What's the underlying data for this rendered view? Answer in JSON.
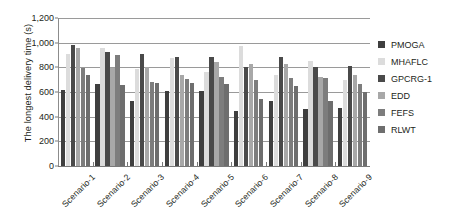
{
  "chart_data": {
    "type": "bar",
    "title": "",
    "subtitle": "",
    "xlabel": "",
    "ylabel": "The longest delivery time (s)",
    "ylim": [
      0,
      1200
    ],
    "ytick_values": [
      0,
      200,
      400,
      600,
      800,
      1000,
      1200
    ],
    "ytick_labels": [
      "0",
      "200",
      "400",
      "600",
      "800",
      "1,000",
      "1,200"
    ],
    "grid": true,
    "legend_position": "right",
    "categories": [
      "Scenario-1",
      "Scenario-2",
      "Scenario-3",
      "Scenario-4",
      "Scenario-5",
      "Scenario-6",
      "Scenario-7",
      "Scenario-8",
      "Scenario-9"
    ],
    "series": [
      {
        "name": "PMOGA",
        "color": "#3f3f3f",
        "values": [
          615,
          665,
          525,
          605,
          610,
          450,
          530,
          460,
          470
        ]
      },
      {
        "name": "MHAFLC",
        "color": "#dcdcdc",
        "values": [
          910,
          955,
          790,
          875,
          760,
          975,
          740,
          855,
          700
        ]
      },
      {
        "name": "GPCRG-1",
        "color": "#4a4a4a",
        "values": [
          980,
          925,
          905,
          880,
          880,
          800,
          880,
          800,
          810
        ]
      },
      {
        "name": "EDD",
        "color": "#a8a8a8",
        "values": [
          960,
          795,
          800,
          740,
          845,
          830,
          825,
          720,
          740
        ]
      },
      {
        "name": "FEFS",
        "color": "#7d7d7d",
        "values": [
          795,
          900,
          680,
          705,
          720,
          700,
          715,
          710,
          665
        ]
      },
      {
        "name": "RLWT",
        "color": "#6e6e6e",
        "values": [
          740,
          660,
          675,
          670,
          665,
          545,
          645,
          530,
          600
        ]
      }
    ]
  },
  "legend": {
    "items": [
      {
        "label": "PMOGA"
      },
      {
        "label": "MHAFLC"
      },
      {
        "label": "GPCRG-1"
      },
      {
        "label": "EDD"
      },
      {
        "label": "FEFS"
      },
      {
        "label": "RLWT"
      }
    ]
  }
}
